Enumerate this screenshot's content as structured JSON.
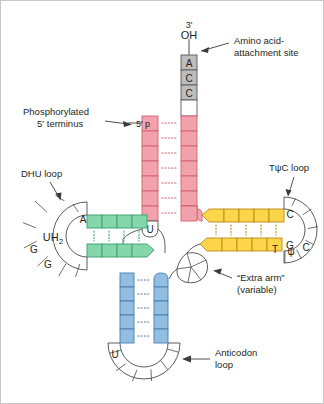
{
  "figure": {
    "background": "#ffffff",
    "border_color": "#c8c8c8"
  },
  "labels": {
    "three_prime": "3'",
    "oh": "OH",
    "amino_acid_site_line1": "Amino acid-",
    "amino_acid_site_line2": "attachment site",
    "phosphorylated_line1": "Phosphorylated",
    "phosphorylated_line2": "5' terminus",
    "five_prime_p": "5' p",
    "dhu_loop": "DHU loop",
    "tpsic_loop": "TψC loop",
    "extra_arm_line1": "“Extra arm”",
    "extra_arm_line2": "(variable)",
    "anticodon_line1": "Anticodon",
    "anticodon_line2": "loop"
  },
  "nucleotides": {
    "acceptor_tail": [
      "A",
      "C",
      "C"
    ],
    "dhu_center": "UH",
    "dhu_center_sub": "2",
    "dhu_ring": [
      "A",
      "G",
      "G"
    ],
    "tpsic_ring": [
      "C",
      "G",
      "T",
      "ψ",
      "C"
    ],
    "acceptor_junction": "U",
    "anticodon_ring": [
      "U"
    ]
  },
  "arms": {
    "acceptor": {
      "name": "acceptor-stem",
      "color": "#f2a2ad",
      "stroke": "#d4606f",
      "base_pairs": 7,
      "bond_color": "#d4606f"
    },
    "dhu": {
      "name": "dhu-stem",
      "color": "#85d7ab",
      "stroke": "#35a06a",
      "base_pairs": 4,
      "bond_color": "#35a06a"
    },
    "tpsic": {
      "name": "tpsic-stem",
      "color": "#fcd54a",
      "stroke": "#b88a16",
      "base_pairs": 5,
      "bond_color": "#b88a16"
    },
    "anticodon": {
      "name": "anticodon-stem",
      "color": "#92bee2",
      "stroke": "#4a7fae",
      "base_pairs": 5,
      "bond_color": "#4a7fae"
    },
    "tail": {
      "name": "acc-tail",
      "color": "#bdbdbd",
      "stroke": "#5a5a5a"
    }
  }
}
